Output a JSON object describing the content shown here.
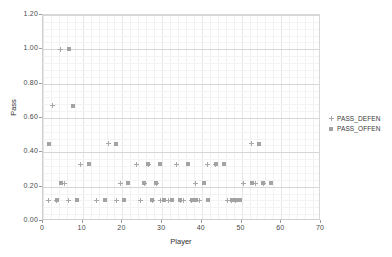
{
  "chart_data": {
    "type": "scatter",
    "title": "",
    "xlabel": "Player",
    "ylabel": "Pass",
    "xlim": [
      0,
      70
    ],
    "ylim": [
      0.0,
      1.2
    ],
    "grid": true,
    "legend_position": "right",
    "xticks": [
      "0",
      "10",
      "20",
      "30",
      "40",
      "50",
      "60",
      "70"
    ],
    "xtick_values": [
      0,
      10,
      20,
      30,
      40,
      50,
      60,
      70
    ],
    "yticks": [
      "0.00",
      "0.20",
      "0.40",
      "0.60",
      "0.80",
      "1.00",
      "1.20"
    ],
    "ytick_values": [
      0.0,
      0.2,
      0.4,
      0.6,
      0.8,
      1.0,
      1.2
    ],
    "series": [
      {
        "name": "PASS_DEFEN",
        "marker": "plus",
        "color": "#a8a8a8",
        "x": [
          1,
          2,
          3,
          4,
          5,
          6,
          7,
          8,
          9,
          10,
          11,
          12,
          13,
          14,
          15,
          16,
          17,
          18,
          19,
          20,
          21,
          22,
          23,
          24,
          25,
          26,
          27,
          28,
          29,
          30,
          31,
          32,
          33,
          34,
          35,
          36,
          37,
          38,
          39,
          40,
          41,
          42,
          43,
          44,
          45,
          46,
          47,
          48,
          49,
          50,
          51,
          52,
          53,
          54,
          55,
          56,
          57,
          58,
          59,
          60
        ],
        "y": [
          0.0,
          0.12,
          0.67,
          0.12,
          1.0,
          0.22,
          0.12,
          0.0,
          0.0,
          0.33,
          0.0,
          0.0,
          0.0,
          0.12,
          0.0,
          0.0,
          0.45,
          0.0,
          0.12,
          0.22,
          0.0,
          0.0,
          0.0,
          0.33,
          0.12,
          0.22,
          0.33,
          0.12,
          0.22,
          0.12,
          0.0,
          0.12,
          0.0,
          0.33,
          0.12,
          0.12,
          0.0,
          0.12,
          0.22,
          0.12,
          0.0,
          0.33,
          0.0,
          0.33,
          0.0,
          0.0,
          0.12,
          0.12,
          0.12,
          0.0,
          0.22,
          0.0,
          0.45,
          0.22,
          0.0,
          0.22,
          0.0,
          0.0,
          0.0,
          0.0
        ]
      },
      {
        "name": "PASS_OFFEN",
        "marker": "square",
        "color": "#a3a3a3",
        "x": [
          1,
          2,
          3,
          4,
          5,
          6,
          7,
          8,
          9,
          10,
          11,
          12,
          13,
          14,
          15,
          16,
          17,
          18,
          19,
          20,
          21,
          22,
          23,
          24,
          25,
          26,
          27,
          28,
          29,
          30,
          31,
          32,
          33,
          34,
          35,
          36,
          37,
          38,
          39,
          40,
          41,
          42,
          43,
          44,
          45,
          46,
          47,
          48,
          49,
          50,
          51,
          52,
          53,
          54,
          55,
          56,
          57,
          58,
          59,
          60
        ],
        "y": [
          0.45,
          0.0,
          0.12,
          0.22,
          0.0,
          1.0,
          0.67,
          0.12,
          0.0,
          0.0,
          0.33,
          0.0,
          0.0,
          0.0,
          0.12,
          0.0,
          0.0,
          0.45,
          0.0,
          0.12,
          0.22,
          0.0,
          0.0,
          0.0,
          0.22,
          0.33,
          0.12,
          0.22,
          0.33,
          0.12,
          0.0,
          0.12,
          0.0,
          0.12,
          0.0,
          0.33,
          0.12,
          0.12,
          0.0,
          0.22,
          0.12,
          0.0,
          0.33,
          0.0,
          0.33,
          0.0,
          0.12,
          0.12,
          0.12,
          0.0,
          0.0,
          0.22,
          0.0,
          0.45,
          0.22,
          0.0,
          0.22,
          0.0,
          0.0,
          0.0
        ]
      }
    ],
    "legend": [
      {
        "label": "PASS_DEFEN",
        "marker": "plus"
      },
      {
        "label": "PASS_OFFEN",
        "marker": "square"
      }
    ]
  }
}
